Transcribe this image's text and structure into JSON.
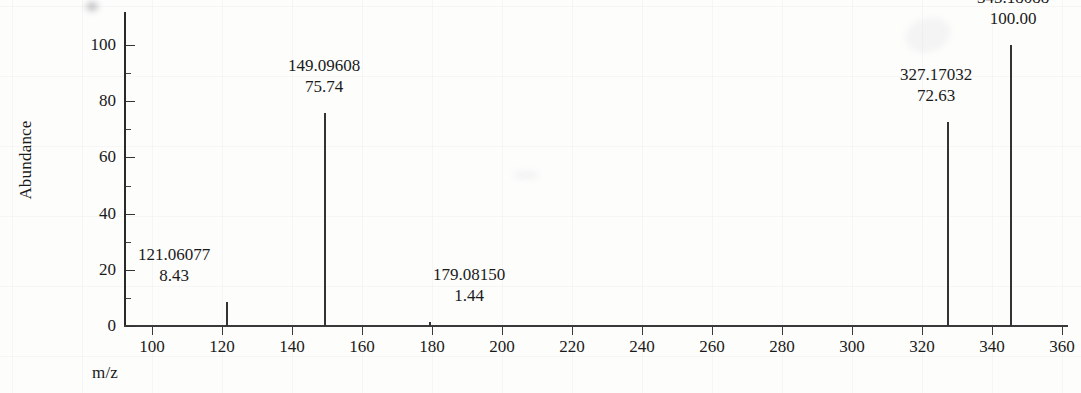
{
  "chart_data": {
    "type": "bar",
    "title": "",
    "subtitle": "",
    "xlabel": "m/z",
    "ylabel": "Abundance",
    "xlim": [
      89,
      376
    ],
    "ylim": [
      0,
      104
    ],
    "grid": "faint-scanned-background",
    "legend": "none",
    "xticks": [
      100,
      120,
      140,
      160,
      180,
      200,
      220,
      240,
      260,
      280,
      300,
      320,
      340,
      360
    ],
    "xtick_labels": [
      "100",
      "120",
      "140",
      "160",
      "180",
      "200",
      "220",
      "240",
      "260",
      "280",
      "300",
      "320",
      "340",
      "360"
    ],
    "yticks": [
      0,
      20,
      40,
      60,
      80,
      100
    ],
    "ytick_labels": [
      "0",
      "20",
      "40",
      "60",
      "80",
      "100"
    ],
    "peaks": [
      {
        "mz": 121.06077,
        "abundance": 8.43,
        "mz_label": "121.06077",
        "abundance_label": "8.43"
      },
      {
        "mz": 149.09608,
        "abundance": 75.74,
        "mz_label": "149.09608",
        "abundance_label": "75.74"
      },
      {
        "mz": 179.0815,
        "abundance": 1.44,
        "mz_label": "179.08150",
        "abundance_label": "1.44"
      },
      {
        "mz": 327.17032,
        "abundance": 72.63,
        "mz_label": "327.17032",
        "abundance_label": "72.63"
      },
      {
        "mz": 345.18088,
        "abundance": 100.0,
        "mz_label": "345.18088",
        "abundance_label": "100.00"
      }
    ],
    "base_peak_mz": 345.18088,
    "colors": {
      "axis": "#333333",
      "peak": "#333333",
      "text": "#1a1a1a",
      "background": "#fdfdfc"
    }
  }
}
